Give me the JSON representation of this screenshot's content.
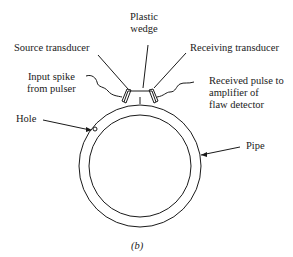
{
  "diagram": {
    "subfigure_label": "(b)",
    "labels": {
      "plastic_wedge_line1": "Plastic",
      "plastic_wedge_line2": "wedge",
      "source_transducer": "Source transducer",
      "receiving_transducer": "Receiving transducer",
      "input_spike_line1": "Input spike",
      "input_spike_line2": "from pulser",
      "received_pulse_line1": "Received pulse to",
      "received_pulse_line2": "amplifier of",
      "received_pulse_line3": "flaw detector",
      "hole": "Hole",
      "pipe": "Pipe"
    },
    "colors": {
      "stroke": "#1a1a1a",
      "background": "#ffffff"
    }
  }
}
